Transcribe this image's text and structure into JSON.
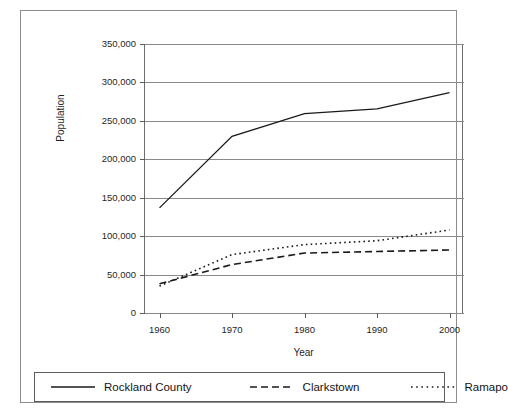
{
  "chart_data": {
    "type": "line",
    "title": "",
    "xlabel": "Year",
    "ylabel": "Population",
    "x": [
      1960,
      1970,
      1980,
      1990,
      2000
    ],
    "xlim": [
      1958,
      2002
    ],
    "ylim": [
      0,
      350000
    ],
    "ytick_labels": [
      "0",
      "50,000",
      "100,000",
      "150,000",
      "200,000",
      "250,000",
      "300,000",
      "350,000"
    ],
    "ytick_values": [
      0,
      50000,
      100000,
      150000,
      200000,
      250000,
      300000,
      350000
    ],
    "xtick_labels": [
      "1960",
      "1970",
      "1980",
      "1990",
      "2000"
    ],
    "grid": "horizontal",
    "legend_position": "bottom",
    "series": [
      {
        "name": "Rockland County",
        "style": "solid",
        "color": "#1a1a1a",
        "values": [
          136803,
          229903,
          259530,
          265475,
          286753
        ]
      },
      {
        "name": "Clarkstown",
        "style": "dashed",
        "color": "#1a1a1a",
        "values": [
          38000,
          63000,
          78000,
          80000,
          82000
        ]
      },
      {
        "name": "Ramapo",
        "style": "dotted",
        "color": "#1a1a1a",
        "values": [
          35000,
          76000,
          89000,
          94000,
          108000
        ]
      }
    ]
  },
  "axes": {
    "y_title": "Population",
    "x_title": "Year"
  },
  "legend": {
    "items": [
      {
        "label": "Rockland County",
        "style": "solid"
      },
      {
        "label": "Clarkstown",
        "style": "dashed"
      },
      {
        "label": "Ramapo",
        "style": "dotted"
      }
    ]
  },
  "colors": {
    "frame": "#8c8c8c",
    "grid": "#8a8a8a",
    "axis": "#5a5a5a",
    "ink": "#1a1a1a",
    "background": "#ffffff"
  }
}
